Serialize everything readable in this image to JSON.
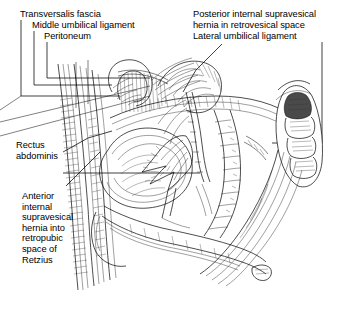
{
  "figure": {
    "kind": "anatomical-line-illustration",
    "background_color": "#ffffff",
    "ink_color": "#000000",
    "width": 351,
    "height": 322
  },
  "labels": {
    "transversalis_fascia": "Transversalis fascia",
    "middle_umbilical_ligament": "Middle umbilical ligament",
    "peritoneum": "Peritoneum",
    "posterior_hernia": "Posterior internal supravesical\nhernia in retrovesical space",
    "lateral_umbilical_ligament": "Lateral umbilical ligament",
    "rectus_abdominis": "Rectus\nabdominis",
    "anterior_hernia": "Anterior\ninternal\nsupravesical\nhernia into\nretropubic\nspace of\nRetzius"
  }
}
